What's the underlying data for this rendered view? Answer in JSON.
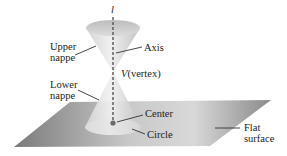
{
  "diagram": {
    "axis_symbol": "l",
    "labels": {
      "upper_nappe": [
        "Upper",
        "nappe"
      ],
      "lower_nappe": [
        "Lower",
        "nappe"
      ],
      "axis": "Axis",
      "vertex_symbol": "V",
      "vertex_text": "(vertex)",
      "center": "Center",
      "circle": "Circle",
      "flat_surface": [
        "Flat",
        "surface"
      ]
    },
    "colors": {
      "plane_dark": "#6e6e6e",
      "plane_light": "#d9d9d9",
      "cone_light": "#e8e8e8",
      "cone_mid": "#cfcfcf",
      "axis_line": "#555555",
      "center_dot": "#6b6b6b",
      "leader_line": "#333333"
    }
  }
}
